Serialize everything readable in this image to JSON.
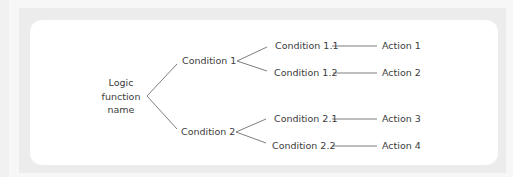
{
  "diagram": {
    "type": "logic-tree",
    "root": {
      "label_lines": [
        "Logic",
        "function",
        "name"
      ]
    },
    "conditions": [
      {
        "label": "Condition 1",
        "subconditions": [
          {
            "label": "Condition 1.1",
            "action": "Action 1"
          },
          {
            "label": "Condition 1.2",
            "action": "Action 2"
          }
        ]
      },
      {
        "label": "Condition 2",
        "subconditions": [
          {
            "label": "Condition 2.1",
            "action": "Action 3"
          },
          {
            "label": "Condition 2.2",
            "action": "Action 4"
          }
        ]
      }
    ],
    "colors": {
      "text": "#3c3c3c",
      "connector": "#6e6e6e",
      "frame": "#ececec",
      "card": "#ffffff"
    }
  }
}
